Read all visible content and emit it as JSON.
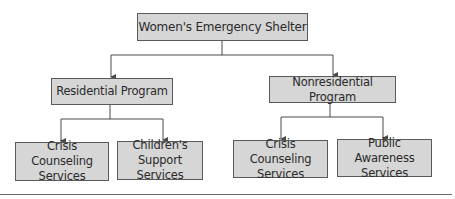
{
  "diagram": {
    "type": "org-chart",
    "root": {
      "id": "root",
      "label": "Women's Emergency Shelter"
    },
    "programs": [
      {
        "id": "residential",
        "label": "Residential Program",
        "children": [
          {
            "id": "res-crisis",
            "lines": [
              "Crisis Counseling",
              "Services"
            ]
          },
          {
            "id": "res-children",
            "lines": [
              "Children's",
              "Support Services"
            ]
          }
        ]
      },
      {
        "id": "nonresidential",
        "label": "Nonresidential Program",
        "children": [
          {
            "id": "nonres-crisis",
            "lines": [
              "Crisis Counseling",
              "Services"
            ]
          },
          {
            "id": "nonres-public",
            "lines": [
              "Public Awareness",
              "Services"
            ]
          }
        ]
      }
    ],
    "colors": {
      "box_fill": "#d6d6d6",
      "box_border": "#5a5a5a",
      "connector": "#4a4a4a",
      "text": "#2a2a2a"
    }
  }
}
